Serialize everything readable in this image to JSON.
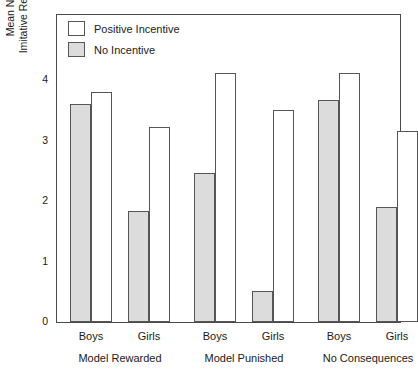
{
  "chart_data": {
    "type": "bar",
    "title": "",
    "subtitle": "",
    "xlabel": "",
    "ylabel_line1": "Mean Number of Different",
    "ylabel_line2": "Imitative Responses Reproduced",
    "ylim": [
      0,
      4.6
    ],
    "yticks": [
      0,
      1,
      2,
      3,
      4
    ],
    "ytick_labels": [
      "0",
      "1",
      "2",
      "3",
      "4"
    ],
    "grid": false,
    "legend_position": "top-left",
    "categories": [
      "Model Rewarded - Boys",
      "Model Rewarded - Girls",
      "Model Punished - Boys",
      "Model Punished - Girls",
      "No Consequences - Boys",
      "No Consequences - Girls"
    ],
    "series": [
      {
        "name": "No Incentive",
        "color": "#dcdcdc",
        "values": [
          3.6,
          1.83,
          2.47,
          0.52,
          3.67,
          1.9
        ]
      },
      {
        "name": "Positive Incentive",
        "color": "#ffffff",
        "values": [
          3.8,
          3.22,
          4.11,
          3.5,
          4.12,
          3.15
        ]
      }
    ],
    "groups": [
      {
        "group_label": "Model Rewarded",
        "subgroups": [
          {
            "label": "Boys",
            "no_incentive": 3.6,
            "positive_incentive": 3.8
          },
          {
            "label": "Girls",
            "no_incentive": 1.83,
            "positive_incentive": 3.22
          }
        ]
      },
      {
        "group_label": "Model Punished",
        "subgroups": [
          {
            "label": "Boys",
            "no_incentive": 2.47,
            "positive_incentive": 4.11
          },
          {
            "label": "Girls",
            "no_incentive": 0.52,
            "positive_incentive": 3.5
          }
        ]
      },
      {
        "group_label": "No Consequences",
        "subgroups": [
          {
            "label": "Boys",
            "no_incentive": 3.67,
            "positive_incentive": 4.12
          },
          {
            "label": "Girls",
            "no_incentive": 1.9,
            "positive_incentive": 3.15
          }
        ]
      }
    ]
  },
  "legend": {
    "items": [
      {
        "label": "Positive Incentive",
        "swatch": "white"
      },
      {
        "label": "No Incentive",
        "swatch": "gray"
      }
    ]
  },
  "axis": {
    "ylabel_line1": "Mean Number of Different",
    "ylabel_line2": "Imitative Responses Reproduced",
    "ytick_labels": [
      "4",
      "3",
      "2",
      "1",
      "0"
    ]
  },
  "xaxis": {
    "sub_labels": [
      "Boys",
      "Girls",
      "Boys",
      "Girls",
      "Boys",
      "Girls"
    ],
    "group_labels": [
      "Model Rewarded",
      "Model Punished",
      "No Consequences"
    ]
  },
  "colors": {
    "bar_gray": "#dcdcdc",
    "bar_white": "#ffffff",
    "bar_outline": "#555555",
    "frame": "#4a4a4a",
    "text": "#1a1a1a"
  }
}
